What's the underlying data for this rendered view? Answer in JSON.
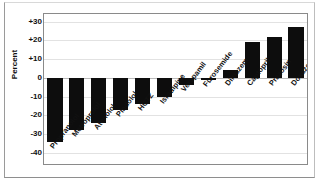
{
  "chart_data": {
    "type": "bar",
    "title": "",
    "subtitle": "",
    "xlabel": "",
    "ylabel": "Percent",
    "ylim": [
      -40,
      30
    ],
    "yticks": [
      30,
      20,
      10,
      0,
      -10,
      -20,
      -30,
      -40
    ],
    "ytick_labels": [
      "+30",
      "+20",
      "+10",
      "0",
      "-10",
      "-20",
      "-30",
      "-40"
    ],
    "grid": true,
    "legend": "none",
    "orientation": "vertical",
    "bar_color": "#0d0d0d",
    "categories": [
      "Propranolol",
      "Metroprolol",
      "Atenolol",
      "Pindolol",
      "HCTZ",
      "Isradipine",
      "Verapamil",
      "Furosemide",
      "Diltiazem",
      "Captopril",
      "Prazosin",
      "Doxazosin"
    ],
    "values": [
      -34,
      -28,
      -24,
      -17,
      -14,
      -10,
      -4,
      -1,
      4,
      19,
      22,
      27
    ],
    "series": [
      {
        "name": "Percent change",
        "values": [
          -34,
          -28,
          -24,
          -17,
          -14,
          -10,
          -4,
          -1,
          4,
          19,
          22,
          27
        ]
      }
    ]
  }
}
